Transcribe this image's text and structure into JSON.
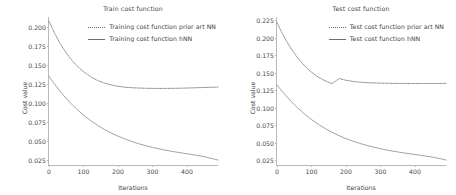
{
  "figure": {
    "background": "#ffffff",
    "line_color": "#7a7a7a"
  },
  "chart_data": [
    {
      "type": "line",
      "panel": "left",
      "title": "Train cost function",
      "xlabel": "Iterations",
      "ylabel": "Cost value",
      "grid": false,
      "legend_position": "upper right",
      "xlim": [
        0,
        490
      ],
      "ylim": [
        0.0185,
        0.2135
      ],
      "xticks": [
        0,
        100,
        200,
        300,
        400
      ],
      "xticklabels": [
        "0",
        "100",
        "200",
        "300",
        "400"
      ],
      "yticks": [
        0.025,
        0.05,
        0.075,
        0.1,
        0.125,
        0.15,
        0.175,
        0.2
      ],
      "yticklabels": [
        "0.025",
        "0.050",
        "0.075",
        "0.100",
        "0.125",
        "0.150",
        "0.175",
        "0.200"
      ],
      "x": [
        0,
        10,
        20,
        30,
        40,
        50,
        60,
        70,
        80,
        90,
        100,
        120,
        140,
        160,
        180,
        200,
        220,
        240,
        260,
        280,
        300,
        330,
        360,
        390,
        420,
        450,
        480,
        490
      ],
      "series": [
        {
          "name": "Training cost function prior art NN",
          "style": "dotted",
          "color": "#6e6e6e",
          "values": [
            0.208,
            0.198,
            0.1888,
            0.1805,
            0.173,
            0.1662,
            0.1601,
            0.1546,
            0.1497,
            0.1454,
            0.1415,
            0.135,
            0.1301,
            0.1265,
            0.124,
            0.1222,
            0.121,
            0.1203,
            0.1199,
            0.1196,
            0.1194,
            0.1194,
            0.1195,
            0.1198,
            0.1202,
            0.1206,
            0.121,
            0.1211
          ]
        },
        {
          "name": "Training cost function hNN",
          "style": "solid",
          "color": "#8a8a8a",
          "values": [
            0.1352,
            0.1288,
            0.1227,
            0.1169,
            0.1114,
            0.1062,
            0.1013,
            0.0967,
            0.0923,
            0.0882,
            0.0843,
            0.0772,
            0.071,
            0.0655,
            0.0607,
            0.0565,
            0.0528,
            0.0495,
            0.0466,
            0.044,
            0.0417,
            0.0387,
            0.0362,
            0.034,
            0.0319,
            0.0295,
            0.0262,
            0.025
          ]
        }
      ]
    },
    {
      "type": "line",
      "panel": "right",
      "title": "Test cost function",
      "xlabel": "Iterations",
      "ylabel": "Cost value",
      "grid": false,
      "legend_position": "upper right",
      "xlim": [
        0,
        490
      ],
      "ylim": [
        0.0185,
        0.23
      ],
      "xticks": [
        0,
        100,
        200,
        300,
        400
      ],
      "xticklabels": [
        "0",
        "100",
        "200",
        "300",
        "400"
      ],
      "yticks": [
        0.025,
        0.05,
        0.075,
        0.1,
        0.125,
        0.15,
        0.175,
        0.2,
        0.225
      ],
      "yticklabels": [
        "0.025",
        "0.050",
        "0.075",
        "0.100",
        "0.125",
        "0.150",
        "0.175",
        "0.200",
        "0.225"
      ],
      "x": [
        0,
        10,
        20,
        30,
        40,
        50,
        60,
        70,
        80,
        90,
        100,
        120,
        140,
        160,
        180,
        200,
        220,
        240,
        260,
        280,
        300,
        330,
        360,
        390,
        420,
        450,
        480,
        490
      ],
      "series": [
        {
          "name": "Test cost function prior art NN",
          "style": "dotted",
          "color": "#6e6e6e",
          "values": [
            0.222,
            0.2118,
            0.2023,
            0.1935,
            0.1855,
            0.1782,
            0.1716,
            0.1656,
            0.1602,
            0.1554,
            0.1511,
            0.144,
            0.1387,
            0.1348,
            0.142,
            0.1396,
            0.138,
            0.1369,
            0.1362,
            0.1358,
            0.1355,
            0.1352,
            0.1351,
            0.135,
            0.135,
            0.135,
            0.1351,
            0.1351
          ]
        },
        {
          "name": "Test cost function hNN",
          "style": "solid",
          "color": "#8a8a8a",
          "values": [
            0.133,
            0.1268,
            0.1209,
            0.1153,
            0.1099,
            0.1049,
            0.1001,
            0.0956,
            0.0913,
            0.0873,
            0.0835,
            0.0766,
            0.0705,
            0.0651,
            0.0604,
            0.0562,
            0.0526,
            0.0494,
            0.0465,
            0.044,
            0.0417,
            0.0388,
            0.0364,
            0.0342,
            0.0321,
            0.0298,
            0.0268,
            0.0256
          ]
        }
      ]
    }
  ]
}
